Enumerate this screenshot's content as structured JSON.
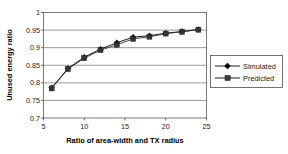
{
  "chart_data": {
    "type": "line",
    "title": "",
    "subtitle": "",
    "xlabel": "Ratio of area-width and TX radius",
    "ylabel": "Unused energy ratio",
    "x": [
      6,
      8,
      10,
      12,
      14,
      16,
      18,
      20,
      22,
      24
    ],
    "series": [
      {
        "name": "Simulated",
        "marker": "diamond",
        "color": "#000000",
        "values": [
          0.786,
          0.841,
          0.873,
          0.896,
          0.914,
          0.93,
          0.934,
          0.941,
          0.946,
          0.952
        ]
      },
      {
        "name": "Predicted",
        "marker": "square",
        "color": "#333333",
        "values": [
          0.784,
          0.839,
          0.87,
          0.893,
          0.908,
          0.925,
          0.931,
          0.94,
          0.945,
          0.951
        ]
      }
    ],
    "xlim": [
      5,
      25
    ],
    "ylim": [
      0.7,
      1
    ],
    "xticks": [
      5,
      10,
      15,
      20,
      25
    ],
    "xtick_labels": [
      "5",
      "10",
      "15",
      "20",
      "25"
    ],
    "yticks": [
      0.7,
      0.75,
      0.8,
      0.85,
      0.9,
      0.95,
      1
    ],
    "ytick_labels": [
      "0.7",
      "0.75",
      "0.8",
      "0.85",
      "0.9",
      "0.95",
      "1"
    ],
    "grid": {
      "horizontal": true,
      "vertical": false,
      "color": "#808080"
    },
    "legend": {
      "position": "right",
      "entries": [
        "Simulated",
        "Predicted"
      ]
    },
    "plot_background": "#ffffff",
    "axis_color": "#4d4d4d"
  },
  "axes": {
    "x_title": "Ratio of area-width and TX radius",
    "y_title": "Unused energy ratio"
  },
  "ytick_labels": {
    "t0": "1",
    "t1": "0.95",
    "t2": "0.9",
    "t3": "0.85",
    "t4": "0.8",
    "t5": "0.75",
    "t6": "0.7"
  },
  "xtick_labels": {
    "t0": "5",
    "t1": "10",
    "t2": "15",
    "t3": "20",
    "t4": "25"
  },
  "legend": {
    "item0": "Simulated",
    "item1": "Predicted"
  }
}
